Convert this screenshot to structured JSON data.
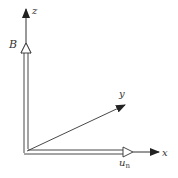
{
  "diagram": {
    "colors": {
      "line": "#333333",
      "hollow_fill": "#ffffff",
      "background": "#ffffff"
    },
    "labels": {
      "z_axis": "z",
      "y_axis": "y",
      "x_axis": "x",
      "B_vector": "B",
      "un_vector_main": "u",
      "un_vector_sub": "n"
    },
    "origin": [
      26,
      152
    ],
    "axes": {
      "z_tip": [
        26,
        8
      ],
      "y_tip": [
        126,
        104
      ],
      "x_tip": [
        160,
        152
      ]
    },
    "vectors": {
      "B_tip": [
        26,
        43
      ],
      "un_tip": [
        133,
        152
      ]
    }
  }
}
